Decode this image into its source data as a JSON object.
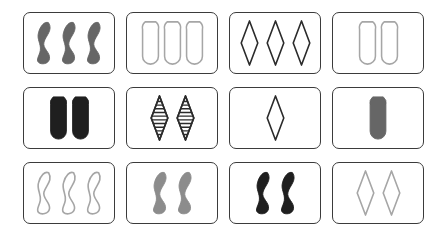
{
  "board": {
    "name": "set-card-board",
    "background_color": "#ffffff",
    "rows": 3,
    "columns": 4,
    "card_border_color": "#3b3b3b",
    "card_background": "#ffffff"
  },
  "palette": {
    "dark_gray": "#666666",
    "medium_gray": "#8c8c8c",
    "light_gray": "#a6a6a6",
    "black": "#1f1f1f",
    "outline_dark": "#2b2b2b",
    "white": "#ffffff"
  },
  "cards": [
    {
      "id": "card-r1c1",
      "row": 1,
      "column": 1,
      "count": 3,
      "shape": "squiggle",
      "shading": "solid",
      "color": "#666666",
      "stroke": "#666666"
    },
    {
      "id": "card-r1c2",
      "row": 1,
      "column": 2,
      "count": 3,
      "shape": "oval",
      "shading": "open",
      "color": "none",
      "stroke": "#a6a6a6"
    },
    {
      "id": "card-r1c3",
      "row": 1,
      "column": 3,
      "count": 3,
      "shape": "diamond",
      "shading": "open",
      "color": "none",
      "stroke": "#2b2b2b"
    },
    {
      "id": "card-r1c4",
      "row": 1,
      "column": 4,
      "count": 2,
      "shape": "oval",
      "shading": "open",
      "color": "none",
      "stroke": "#a6a6a6"
    },
    {
      "id": "card-r2c1",
      "row": 2,
      "column": 1,
      "count": 2,
      "shape": "oval",
      "shading": "solid",
      "color": "#1f1f1f",
      "stroke": "#1f1f1f"
    },
    {
      "id": "card-r2c2",
      "row": 2,
      "column": 2,
      "count": 2,
      "shape": "diamond",
      "shading": "striped",
      "color": "#2b2b2b",
      "stroke": "#2b2b2b"
    },
    {
      "id": "card-r2c3",
      "row": 2,
      "column": 3,
      "count": 1,
      "shape": "diamond",
      "shading": "open",
      "color": "none",
      "stroke": "#2b2b2b"
    },
    {
      "id": "card-r2c4",
      "row": 2,
      "column": 4,
      "count": 1,
      "shape": "oval",
      "shading": "solid",
      "color": "#666666",
      "stroke": "#666666"
    },
    {
      "id": "card-r3c1",
      "row": 3,
      "column": 1,
      "count": 3,
      "shape": "squiggle",
      "shading": "open",
      "color": "none",
      "stroke": "#a6a6a6"
    },
    {
      "id": "card-r3c2",
      "row": 3,
      "column": 2,
      "count": 2,
      "shape": "squiggle",
      "shading": "solid",
      "color": "#8c8c8c",
      "stroke": "#8c8c8c"
    },
    {
      "id": "card-r3c3",
      "row": 3,
      "column": 3,
      "count": 2,
      "shape": "squiggle",
      "shading": "solid",
      "color": "#1f1f1f",
      "stroke": "#1f1f1f"
    },
    {
      "id": "card-r3c4",
      "row": 3,
      "column": 4,
      "count": 2,
      "shape": "diamond",
      "shading": "open",
      "color": "none",
      "stroke": "#a6a6a6"
    }
  ]
}
